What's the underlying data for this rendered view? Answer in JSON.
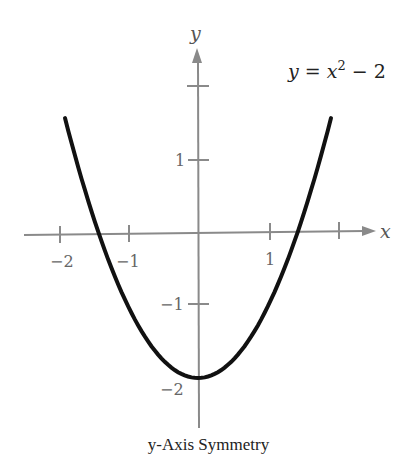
{
  "chart_data": {
    "type": "line",
    "title": "y-Axis Symmetry",
    "equation": "y = x² − 2",
    "xlabel": "x",
    "ylabel": "y",
    "x_ticks": [
      -2,
      -1,
      1,
      2
    ],
    "x_tick_labels": [
      "−2",
      "−1",
      "1"
    ],
    "y_ticks": [
      2,
      1,
      -1,
      -2
    ],
    "y_tick_labels": [
      "1",
      "−1",
      "−2"
    ],
    "xlim": [
      -2.2,
      2.5
    ],
    "ylim": [
      -2.4,
      2.5
    ],
    "grid": false,
    "series": [
      {
        "name": "y = x^2 - 2",
        "x": [
          -1.9,
          -1.5,
          -1.0,
          -0.5,
          0,
          0.5,
          1.0,
          1.5,
          1.9
        ],
        "values": [
          1.61,
          0.25,
          -1.0,
          -1.75,
          -2.0,
          -1.75,
          -1.0,
          0.25,
          1.61
        ]
      }
    ],
    "colors": {
      "curve": "#111111",
      "axes": "#888888"
    }
  },
  "labels": {
    "caption": "y-Axis Symmetry",
    "equation_lhs": "y = x",
    "equation_exp": "2",
    "equation_rhs": " − 2",
    "x_axis": "x",
    "y_axis": "y",
    "tick_xm2": "−2",
    "tick_xm1": "−1",
    "tick_x1": "1",
    "tick_y1": "1",
    "tick_ym1": "−1",
    "tick_ym2": "−2"
  }
}
